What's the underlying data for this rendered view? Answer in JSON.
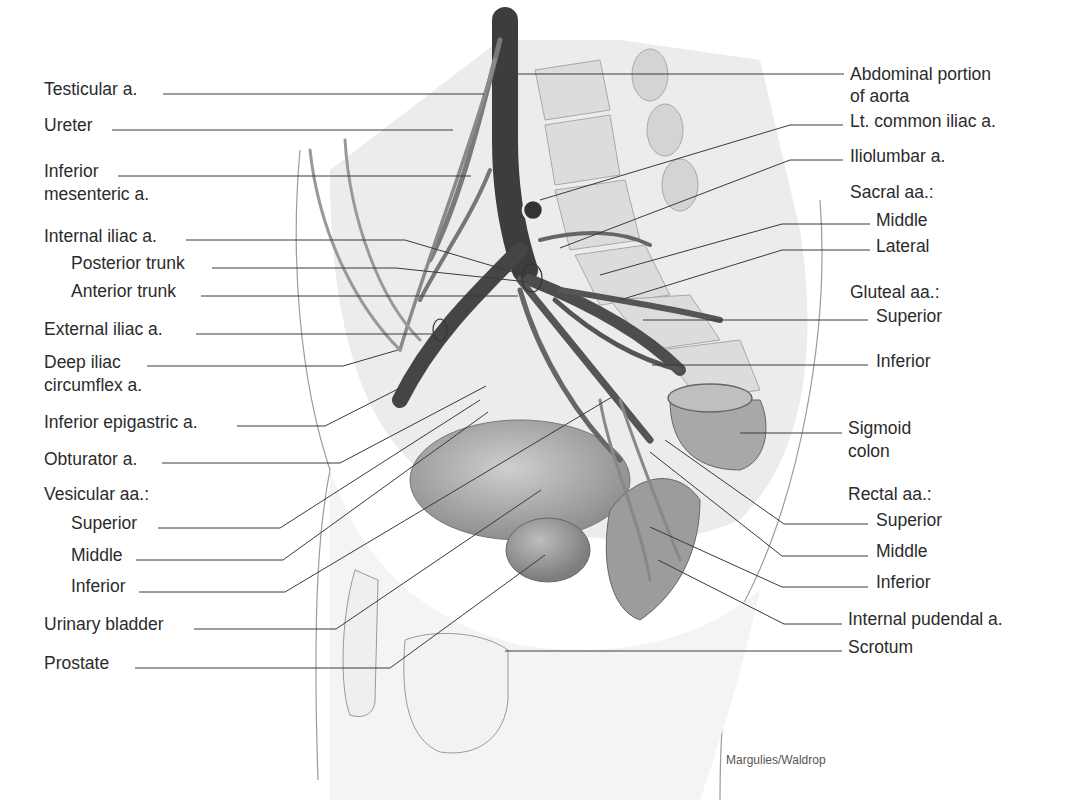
{
  "figure": {
    "credit": "Margulies/Waldrop",
    "left_labels": [
      {
        "id": "testicular",
        "text": "Testicular a.",
        "x": 44,
        "y": 79
      },
      {
        "id": "ureter",
        "text": "Ureter",
        "x": 44,
        "y": 115
      },
      {
        "id": "inf-mesenteric-1",
        "text": "Inferior",
        "x": 44,
        "y": 161
      },
      {
        "id": "inf-mesenteric-2",
        "text": "mesenteric a.",
        "x": 44,
        "y": 184
      },
      {
        "id": "internal-iliac",
        "text": "Internal iliac a.",
        "x": 44,
        "y": 226
      },
      {
        "id": "posterior-trunk",
        "text": "Posterior trunk",
        "x": 71,
        "y": 253
      },
      {
        "id": "anterior-trunk",
        "text": "Anterior trunk",
        "x": 71,
        "y": 281
      },
      {
        "id": "external-iliac",
        "text": "External iliac a.",
        "x": 44,
        "y": 319
      },
      {
        "id": "deep-iliac-1",
        "text": "Deep iliac",
        "x": 44,
        "y": 352
      },
      {
        "id": "deep-iliac-2",
        "text": "circumflex a.",
        "x": 44,
        "y": 375
      },
      {
        "id": "inf-epigastric",
        "text": "Inferior epigastric a.",
        "x": 44,
        "y": 412
      },
      {
        "id": "obturator",
        "text": "Obturator a.",
        "x": 44,
        "y": 449
      },
      {
        "id": "vesicular",
        "text": "Vesicular aa.:",
        "x": 44,
        "y": 484
      },
      {
        "id": "ves-superior",
        "text": "Superior",
        "x": 71,
        "y": 513
      },
      {
        "id": "ves-middle",
        "text": "Middle",
        "x": 71,
        "y": 545
      },
      {
        "id": "ves-inferior",
        "text": "Inferior",
        "x": 71,
        "y": 576
      },
      {
        "id": "urinary-bladder",
        "text": "Urinary bladder",
        "x": 44,
        "y": 614
      },
      {
        "id": "prostate",
        "text": "Prostate",
        "x": 44,
        "y": 653
      }
    ],
    "right_labels": [
      {
        "id": "abdominal-aorta-1",
        "text": "Abdominal portion",
        "x": 850,
        "y": 64
      },
      {
        "id": "abdominal-aorta-2",
        "text": "of aorta",
        "x": 850,
        "y": 86
      },
      {
        "id": "lt-common-iliac",
        "text": "Lt. common iliac a.",
        "x": 850,
        "y": 111
      },
      {
        "id": "iliolumbar",
        "text": "Iliolumbar a.",
        "x": 850,
        "y": 146
      },
      {
        "id": "sacral",
        "text": "Sacral aa.:",
        "x": 850,
        "y": 182
      },
      {
        "id": "sacral-middle",
        "text": "Middle",
        "x": 876,
        "y": 210
      },
      {
        "id": "sacral-lateral",
        "text": "Lateral",
        "x": 876,
        "y": 236
      },
      {
        "id": "gluteal",
        "text": "Gluteal aa.:",
        "x": 850,
        "y": 282
      },
      {
        "id": "gluteal-superior",
        "text": "Superior",
        "x": 876,
        "y": 306
      },
      {
        "id": "gluteal-inferior",
        "text": "Inferior",
        "x": 876,
        "y": 351
      },
      {
        "id": "sigmoid-1",
        "text": "Sigmoid",
        "x": 848,
        "y": 418
      },
      {
        "id": "sigmoid-2",
        "text": "colon",
        "x": 848,
        "y": 441
      },
      {
        "id": "rectal",
        "text": "Rectal aa.:",
        "x": 848,
        "y": 484
      },
      {
        "id": "rectal-superior",
        "text": "Superior",
        "x": 876,
        "y": 510
      },
      {
        "id": "rectal-middle",
        "text": "Middle",
        "x": 876,
        "y": 541
      },
      {
        "id": "rectal-inferior",
        "text": "Inferior",
        "x": 876,
        "y": 572
      },
      {
        "id": "internal-pudendal",
        "text": "Internal pudendal a.",
        "x": 848,
        "y": 609
      },
      {
        "id": "scrotum",
        "text": "Scrotum",
        "x": 848,
        "y": 637
      }
    ]
  }
}
